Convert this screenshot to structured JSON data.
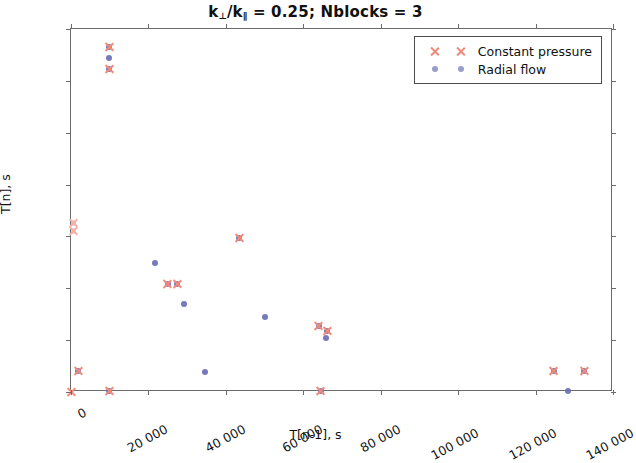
{
  "chart_data": {
    "type": "scatter",
    "title": "k⊥/k∥ = 0.25; Nblocks = 3",
    "title_main": "k",
    "title_sub1": "⊥",
    "title_mid": "/k",
    "title_sub2": "∥",
    "title_tail": " = 0.25; Nblocks = 3",
    "xlabel": "T[n-1], s",
    "ylabel": "T[n], s",
    "xlim": [
      0,
      140000
    ],
    "ylim": [
      0,
      140000
    ],
    "xticks": [
      0,
      20000,
      40000,
      60000,
      80000,
      100000,
      120000,
      140000
    ],
    "yticks": [
      0,
      20000,
      40000,
      60000,
      80000,
      100000,
      120000,
      140000
    ],
    "xticklabels": [
      "0",
      "20 000",
      "40 000",
      "60 000",
      "80 000",
      "100 000",
      "120 000",
      "140 000"
    ],
    "yticklabels": [
      "0",
      "20 000",
      "40 000",
      "60 000",
      "80 000",
      "100 000",
      "120 000",
      "140 000"
    ],
    "grid": false,
    "legend_position": "upper right",
    "series": [
      {
        "name": "Constant pressure",
        "marker": "x",
        "color": "#f08a7a",
        "points": [
          {
            "x": 0,
            "y": 0
          },
          {
            "x": 9800,
            "y": 133000
          },
          {
            "x": 9800,
            "y": 124500
          },
          {
            "x": 1800,
            "y": 8000
          },
          {
            "x": 9800,
            "y": 500
          },
          {
            "x": 25000,
            "y": 41500
          },
          {
            "x": 27400,
            "y": 41500
          },
          {
            "x": 43400,
            "y": 59500
          },
          {
            "x": 64000,
            "y": 25500
          },
          {
            "x": 66100,
            "y": 23500
          },
          {
            "x": 64500,
            "y": 500
          },
          {
            "x": 124700,
            "y": 8000
          },
          {
            "x": 132500,
            "y": 8000
          },
          {
            "x": 600,
            "y": 65000
          },
          {
            "x": 600,
            "y": 62000
          }
        ]
      },
      {
        "name": "Radial flow",
        "marker": "o",
        "color": "#6b6fb4",
        "points": [
          {
            "x": 9800,
            "y": 133000
          },
          {
            "x": 9800,
            "y": 129000
          },
          {
            "x": 9800,
            "y": 124500
          },
          {
            "x": 600,
            "y": 65000
          },
          {
            "x": 600,
            "y": 62000
          },
          {
            "x": 1800,
            "y": 8000
          },
          {
            "x": 9800,
            "y": 500
          },
          {
            "x": 21600,
            "y": 49800
          },
          {
            "x": 25000,
            "y": 41500
          },
          {
            "x": 27400,
            "y": 41500
          },
          {
            "x": 29200,
            "y": 34000
          },
          {
            "x": 34500,
            "y": 7800
          },
          {
            "x": 43400,
            "y": 59500
          },
          {
            "x": 50200,
            "y": 28800
          },
          {
            "x": 64000,
            "y": 25500
          },
          {
            "x": 66100,
            "y": 23500
          },
          {
            "x": 65800,
            "y": 20800
          },
          {
            "x": 64500,
            "y": 500
          },
          {
            "x": 128400,
            "y": 500
          },
          {
            "x": 124700,
            "y": 8000
          },
          {
            "x": 132500,
            "y": 8000
          }
        ]
      }
    ]
  },
  "legend": {
    "entries": [
      {
        "label": "Constant pressure",
        "marker": "x"
      },
      {
        "label": "Radial flow",
        "marker": "o"
      }
    ]
  }
}
